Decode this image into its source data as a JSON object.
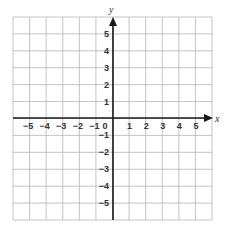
{
  "graph": {
    "x_axis_label": "x",
    "y_axis_label": "y",
    "origin_label": "0",
    "x_ticks": [
      {
        "value": -5,
        "label": "−5"
      },
      {
        "value": -4,
        "label": "−4"
      },
      {
        "value": -3,
        "label": "−3"
      },
      {
        "value": -2,
        "label": "−2"
      },
      {
        "value": -1,
        "label": "−1"
      },
      {
        "value": 1,
        "label": "1"
      },
      {
        "value": 2,
        "label": "2"
      },
      {
        "value": 3,
        "label": "3"
      },
      {
        "value": 4,
        "label": "4"
      },
      {
        "value": 5,
        "label": "5"
      }
    ],
    "y_ticks": [
      {
        "value": 5,
        "label": "5"
      },
      {
        "value": 4,
        "label": "4"
      },
      {
        "value": 3,
        "label": "3"
      },
      {
        "value": 2,
        "label": "2"
      },
      {
        "value": 1,
        "label": "1"
      },
      {
        "value": -1,
        "label": "−1"
      },
      {
        "value": -2,
        "label": "−2"
      },
      {
        "value": -3,
        "label": "−3"
      },
      {
        "value": -4,
        "label": "−4"
      },
      {
        "value": -5,
        "label": "−5"
      }
    ],
    "x_range": [
      -6,
      6
    ],
    "y_range": [
      -6,
      6
    ],
    "grid": true,
    "colors": {
      "grid": "#b5b5b5",
      "axis": "#1a1a1a",
      "text": "#333333"
    }
  }
}
